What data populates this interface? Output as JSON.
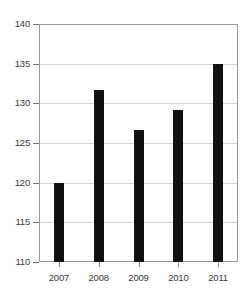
{
  "chart_data": {
    "type": "bar",
    "title": "",
    "xlabel": "",
    "ylabel": "",
    "categories": [
      "2007",
      "2008",
      "2009",
      "2010",
      "2011"
    ],
    "values": [
      120.0,
      131.7,
      126.7,
      129.2,
      135.0
    ],
    "ylim": [
      110,
      140
    ],
    "yticks": [
      110,
      115,
      120,
      125,
      130,
      135,
      140
    ],
    "ytick_labels": [
      "110",
      "115",
      "120",
      "125",
      "130",
      "135",
      "140"
    ],
    "grid": true,
    "legend": null,
    "bar_color": "#111111",
    "grid_color": "#d2d2d2",
    "axis_color": "#9a9a9a"
  },
  "clipped_title": "",
  "axis": {
    "y_labels": [
      "140",
      "135",
      "130",
      "125",
      "120",
      "115",
      "110"
    ],
    "x_labels": [
      "2007",
      "2008",
      "2009",
      "2010",
      "2011"
    ]
  }
}
